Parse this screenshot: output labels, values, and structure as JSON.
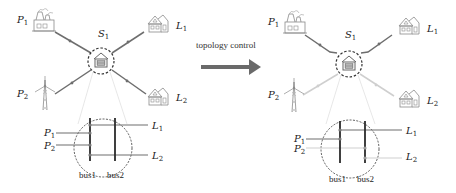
{
  "arrow": {
    "label": "topology control"
  },
  "panels": [
    {
      "id": "before",
      "substation": {
        "label": "S",
        "sub": "1"
      },
      "sources": [
        {
          "label": "P",
          "sub": "1",
          "icon": "power-plant-icon"
        },
        {
          "label": "P",
          "sub": "2",
          "icon": "wind-turbine-icon"
        }
      ],
      "loads": [
        {
          "label": "L",
          "sub": "1",
          "icon": "house-icon"
        },
        {
          "label": "L",
          "sub": "2",
          "icon": "house-icon"
        }
      ],
      "detail": {
        "inputs": [
          {
            "label": "P",
            "sub": "1"
          },
          {
            "label": "P",
            "sub": "2"
          }
        ],
        "outputs": [
          {
            "label": "L",
            "sub": "1"
          },
          {
            "label": "L",
            "sub": "2"
          }
        ],
        "buses": [
          "bus1",
          "bus2"
        ]
      }
    },
    {
      "id": "after",
      "substation": {
        "label": "S",
        "sub": "1"
      },
      "sources": [
        {
          "label": "P",
          "sub": "1",
          "icon": "power-plant-icon"
        },
        {
          "label": "P",
          "sub": "2",
          "icon": "wind-turbine-icon"
        }
      ],
      "loads": [
        {
          "label": "L",
          "sub": "1",
          "icon": "house-icon"
        },
        {
          "label": "L",
          "sub": "2",
          "icon": "house-icon"
        }
      ],
      "detail": {
        "inputs": [
          {
            "label": "P",
            "sub": "1"
          },
          {
            "label": "P",
            "sub": "2"
          }
        ],
        "outputs": [
          {
            "label": "L",
            "sub": "1"
          },
          {
            "label": "L",
            "sub": "2"
          }
        ],
        "buses": [
          "bus1",
          "bus2"
        ]
      }
    }
  ],
  "colors": {
    "active_line": "#6e6e6e",
    "inactive_line": "#cfcfcf",
    "bus": "#2b2b2b",
    "arrow": "#6a6a6a",
    "icon": "#8a8a8a"
  }
}
